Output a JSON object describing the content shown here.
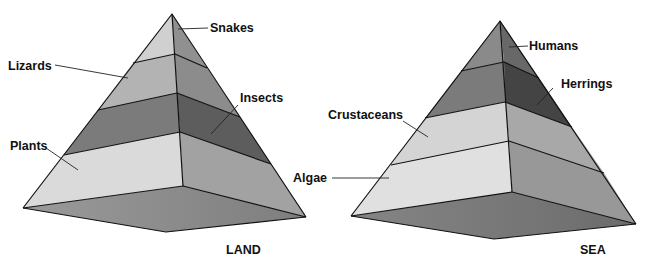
{
  "diagram": {
    "type": "ecological pyramids",
    "pyramids": [
      {
        "id": "land",
        "caption": "LAND",
        "levels_top_to_bottom": [
          {
            "label": "Snakes",
            "left_color": "#d2d2d2",
            "right_color": "#8f8f8f"
          },
          {
            "label": "Lizards",
            "left_color": "#b4b4b4",
            "right_color": "#8a8a8a"
          },
          {
            "label": "Insects",
            "left_color": "#7a7a7a",
            "right_color": "#5c5c5c"
          },
          {
            "label": "Plants",
            "left_color": "#dcdcdc",
            "right_color": "#a3a3a3"
          }
        ],
        "base_color": "#8e8e8e"
      },
      {
        "id": "sea",
        "caption": "SEA",
        "levels_top_to_bottom": [
          {
            "label": "Humans",
            "left_color": "#8a8a8a",
            "right_color": "#6a6a6a"
          },
          {
            "label": "Herrings",
            "left_color": "#7c7c7c",
            "right_color": "#444444"
          },
          {
            "label": "Crustaceans",
            "left_color": "#d6d6d6",
            "right_color": "#a9a9a9"
          },
          {
            "label": "Algae",
            "left_color": "#e2e2e2",
            "right_color": "#9a9a9a"
          }
        ],
        "base_color": "#7a7a7a"
      }
    ]
  },
  "labels": {
    "land": {
      "snakes": "Snakes",
      "lizards": "Lizards",
      "insects": "Insects",
      "plants": "Plants",
      "caption": "LAND"
    },
    "sea": {
      "humans": "Humans",
      "herrings": "Herrings",
      "crustaceans": "Crustaceans",
      "algae": "Algae",
      "caption": "SEA"
    }
  }
}
